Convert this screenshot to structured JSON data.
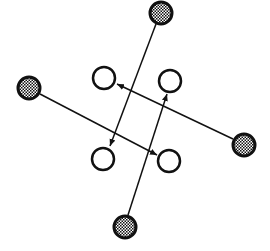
{
  "diagram": {
    "type": "node-link",
    "colors": {
      "stroke": "#111111",
      "hatch": "#111111",
      "background": "#ffffff",
      "open_fill": "#ffffff"
    },
    "outer_nodes": [
      {
        "id": "top",
        "style": "hatched",
        "cx": 161,
        "cy": 13,
        "r": 11
      },
      {
        "id": "left",
        "style": "hatched",
        "cx": 29,
        "cy": 88,
        "r": 11
      },
      {
        "id": "right",
        "style": "hatched",
        "cx": 244,
        "cy": 145,
        "r": 11
      },
      {
        "id": "bottom",
        "style": "hatched",
        "cx": 125,
        "cy": 227,
        "r": 11
      }
    ],
    "inner_nodes": [
      {
        "id": "upper-left",
        "style": "open",
        "cx": 104,
        "cy": 78,
        "r": 11
      },
      {
        "id": "upper-right",
        "style": "open",
        "cx": 170,
        "cy": 81,
        "r": 11
      },
      {
        "id": "lower-left",
        "style": "open",
        "cx": 103,
        "cy": 159,
        "r": 11
      },
      {
        "id": "lower-right",
        "style": "open",
        "cx": 169,
        "cy": 161,
        "r": 11
      }
    ],
    "edges": [
      {
        "from": "top",
        "to": "lower-left",
        "x1": 156,
        "y1": 24,
        "x2": 110,
        "y2": 146
      },
      {
        "from": "left",
        "to": "lower-right",
        "x1": 40,
        "y1": 94,
        "x2": 157,
        "y2": 155
      },
      {
        "from": "right",
        "to": "upper-left",
        "x1": 233,
        "y1": 139,
        "x2": 117,
        "y2": 84
      },
      {
        "from": "bottom",
        "to": "upper-right",
        "x1": 128,
        "y1": 215,
        "x2": 167,
        "y2": 94
      }
    ]
  }
}
